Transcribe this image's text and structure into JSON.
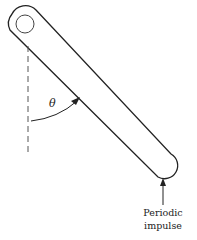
{
  "diagram": {
    "angle_label": "θ",
    "force_label_line1": "Periodic",
    "force_label_line2": "impulse",
    "colors": {
      "stroke": "#222222",
      "dashed": "#555555",
      "background": "#ffffff"
    }
  }
}
